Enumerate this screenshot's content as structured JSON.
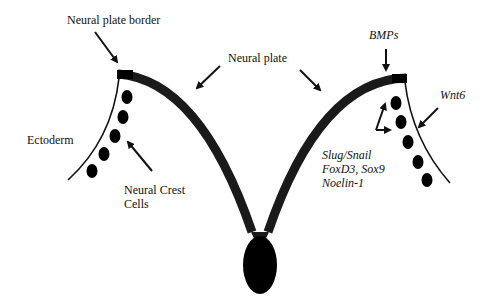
{
  "diagram": {
    "type": "neural plate / neural crest induction schematic",
    "labels": {
      "neural_plate_border": "Neural plate border",
      "neural_plate": "Neural plate",
      "ectoderm": "Ectoderm",
      "neural_crest_cells_line1": "Neural Crest",
      "neural_crest_cells_line2": "Cells",
      "bmps": "BMPs",
      "wnt6": "Wnt6",
      "markers_line1": "Slug/Snail",
      "markers_line2": "FoxD3, Sox9",
      "markers_line3": "Noelin-1"
    },
    "colors": {
      "ink": "#111111",
      "plate_fill": "#1a1a1a",
      "background": "#ffffff"
    }
  }
}
